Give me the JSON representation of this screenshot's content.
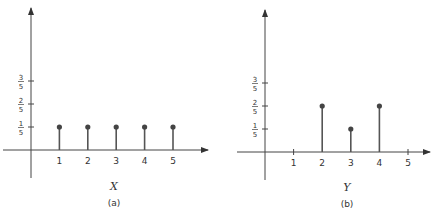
{
  "chart_data": [
    {
      "type": "stem",
      "panel": "(a)",
      "xlabel": "X",
      "ylabel": "",
      "x": [
        1,
        2,
        3,
        4,
        5
      ],
      "values": [
        0.2,
        0.2,
        0.2,
        0.2,
        0.2
      ],
      "value_labels": [
        "1/5",
        "1/5",
        "1/5",
        "1/5",
        "1/5"
      ],
      "x_ticks": [
        "1",
        "2",
        "3",
        "4",
        "5"
      ],
      "y_ticks": [
        {
          "num": "1",
          "den": "5",
          "value": 0.2
        },
        {
          "num": "2",
          "den": "5",
          "value": 0.4
        },
        {
          "num": "3",
          "den": "5",
          "value": 0.6
        }
      ],
      "grid": false
    },
    {
      "type": "stem",
      "panel": "(b)",
      "xlabel": "Y",
      "ylabel": "",
      "x": [
        2,
        3,
        4
      ],
      "values": [
        0.4,
        0.2,
        0.4
      ],
      "value_labels": [
        "2/5",
        "1/5",
        "2/5"
      ],
      "x_ticks": [
        "1",
        "2",
        "3",
        "4",
        "5"
      ],
      "y_ticks": [
        {
          "num": "1",
          "den": "5",
          "value": 0.2
        },
        {
          "num": "2",
          "den": "5",
          "value": 0.4
        },
        {
          "num": "3",
          "den": "5",
          "value": 0.6
        }
      ],
      "grid": false
    }
  ],
  "panels": {
    "a": {
      "caption": "(a)",
      "axis_var": "X"
    },
    "b": {
      "caption": "(b)",
      "axis_var": "Y"
    }
  },
  "colors": {
    "ink": "#333333",
    "stem": "#555555"
  }
}
